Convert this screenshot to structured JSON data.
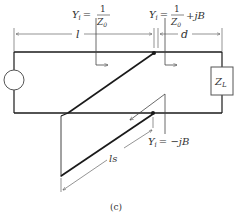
{
  "diagram": {
    "caption": "(c)",
    "labels": {
      "yi_left_prefix": "Y",
      "yi_left_sub": "i",
      "yi_left_eq": "=",
      "yi_left_num": "1",
      "yi_left_den": "Z",
      "yi_left_den_sub": "0",
      "yi_right_prefix": "Y",
      "yi_right_sub": "i",
      "yi_right_eq": "=",
      "yi_right_num": "1",
      "yi_right_den": "Z",
      "yi_right_den_sub": "0",
      "yi_right_suffix": "+jB",
      "yi_stub_prefix": "Y",
      "yi_stub_sub": "i",
      "yi_stub_rhs": "= −jB",
      "dim_l": "l",
      "dim_d": "d",
      "dim_ls": "ls",
      "load": "Z",
      "load_sub": "L"
    },
    "colors": {
      "line": "#1a1a1a",
      "thin": "#444444",
      "text": "#333333"
    }
  }
}
